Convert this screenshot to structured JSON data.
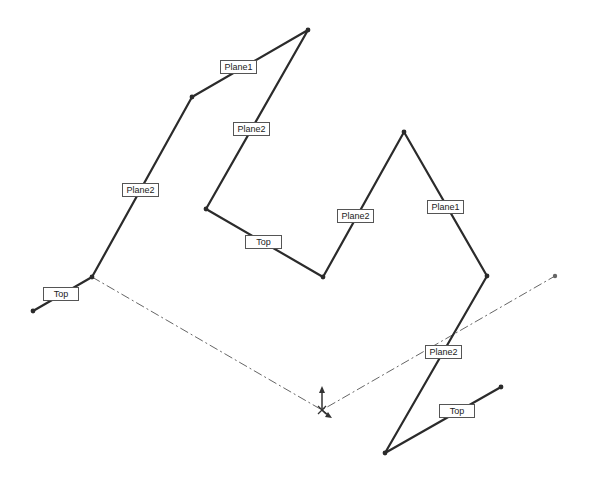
{
  "diagram": {
    "type": "3d-sketch-path",
    "colors": {
      "path": "#2b2b2b",
      "centerline": "#666666",
      "label_border": "#555555",
      "background": "#ffffff"
    },
    "path_vertices": [
      [
        33,
        311
      ],
      [
        92,
        277
      ],
      [
        192,
        97
      ],
      [
        308,
        30
      ],
      [
        206,
        209
      ],
      [
        323,
        277
      ],
      [
        404,
        132
      ],
      [
        487,
        276
      ],
      [
        385,
        453
      ],
      [
        501,
        387
      ]
    ],
    "centerline": {
      "points": [
        [
          92,
          277
        ],
        [
          322,
          410
        ],
        [
          555,
          276
        ]
      ]
    },
    "origin": {
      "x": 322,
      "y": 410
    },
    "labels": [
      {
        "text": "Top",
        "x": 43,
        "y": 287,
        "w": 34
      },
      {
        "text": "Plane2",
        "x": 122,
        "y": 183,
        "w": 35
      },
      {
        "text": "Plane1",
        "x": 220,
        "y": 60,
        "w": 35
      },
      {
        "text": "Plane2",
        "x": 233,
        "y": 122,
        "w": 35
      },
      {
        "text": "Top",
        "x": 245,
        "y": 235,
        "w": 35
      },
      {
        "text": "Plane2",
        "x": 337,
        "y": 209,
        "w": 35
      },
      {
        "text": "Plane1",
        "x": 427,
        "y": 200,
        "w": 35
      },
      {
        "text": "Plane2",
        "x": 425,
        "y": 345,
        "w": 35
      },
      {
        "text": "Top",
        "x": 439,
        "y": 404,
        "w": 34
      }
    ]
  }
}
